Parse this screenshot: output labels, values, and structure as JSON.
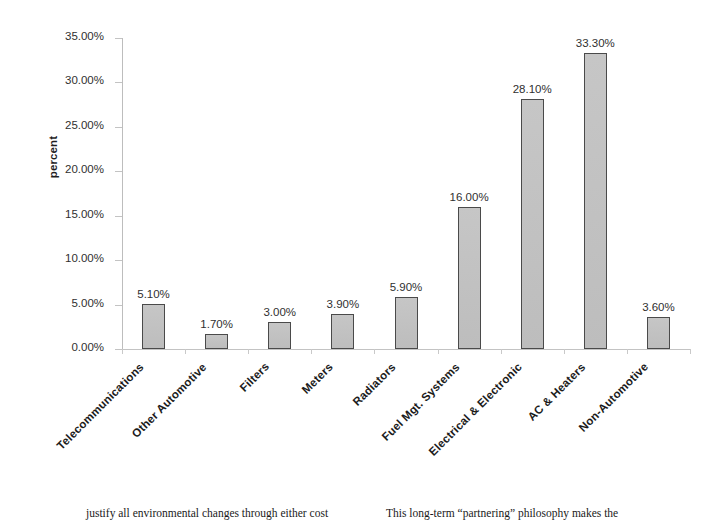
{
  "chart_data": {
    "type": "bar",
    "title": "",
    "xlabel": "",
    "ylabel": "percent",
    "ylim": [
      0,
      35
    ],
    "ytick_step": 5,
    "grid": false,
    "legend": "none",
    "value_label_format": "percent-2dp",
    "categories": [
      "Telecommunications",
      "Other Automotive",
      "Filters",
      "Meters",
      "Radiators",
      "Fuel Mgt. Systems",
      "Electrical & Electronic",
      "AC & Heaters",
      "Non-Automotive"
    ],
    "values": [
      5.1,
      1.7,
      3.0,
      3.9,
      5.9,
      16.0,
      28.1,
      33.3,
      3.6
    ],
    "value_labels": [
      "5.10%",
      "1.70%",
      "3.00%",
      "3.90%",
      "5.90%",
      "16.00%",
      "28.10%",
      "33.30%",
      "3.60%"
    ],
    "ytick_labels": [
      "35.00%",
      "30.00%",
      "25.00%",
      "20.00%",
      "15.00%",
      "10.00%",
      "5.00%",
      "0.00%"
    ],
    "ytick_values": [
      35,
      30,
      25,
      20,
      15,
      10,
      5,
      0
    ],
    "colors": {
      "bar_fill": "#c2c2c2",
      "bar_border": "#4a4a4a",
      "axis": "#c3c3c3",
      "text": "#303030"
    }
  },
  "page_text": {
    "left_column": "justify all environmental changes through either cost",
    "right_column": "This long-term “partnering” philosophy makes the"
  }
}
